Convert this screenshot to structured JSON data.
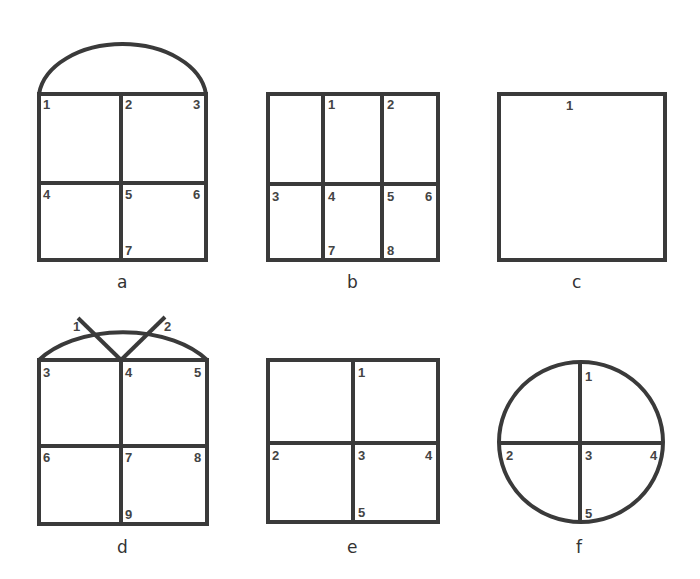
{
  "diagrams": {
    "a": {
      "caption": "a",
      "shape": "arched-window-2x2",
      "labels": [
        "1",
        "2",
        "3",
        "4",
        "5",
        "6",
        "7"
      ]
    },
    "b": {
      "caption": "b",
      "shape": "rectangle-3x2",
      "labels": [
        "1",
        "2",
        "3",
        "4",
        "5",
        "6",
        "7",
        "8"
      ]
    },
    "c": {
      "caption": "c",
      "shape": "square-single",
      "labels": [
        "1"
      ]
    },
    "d": {
      "caption": "d",
      "shape": "arched-window-2x2-with-fan",
      "labels": [
        "1",
        "2",
        "3",
        "4",
        "5",
        "6",
        "7",
        "8",
        "9"
      ]
    },
    "e": {
      "caption": "e",
      "shape": "square-2x2",
      "labels": [
        "1",
        "2",
        "3",
        "4",
        "5"
      ]
    },
    "f": {
      "caption": "f",
      "shape": "circle-quartered",
      "labels": [
        "1",
        "2",
        "3",
        "4",
        "5"
      ]
    }
  },
  "colors": {
    "stroke": "#3a3a3a",
    "label": "#444444",
    "background": "#ffffff"
  }
}
